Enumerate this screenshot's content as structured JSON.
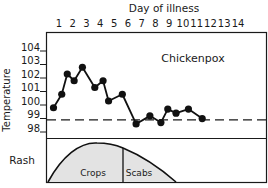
{
  "chart_data": {
    "type": "line",
    "title": "Chickenpox",
    "xlabel": "Day of illness",
    "ylabel": "Temperature",
    "x_ticks": [
      "1",
      "2",
      "3",
      "4",
      "5",
      "6",
      "7",
      "8",
      "9",
      "10",
      "11",
      "12",
      "13",
      "14"
    ],
    "y_ticks": [
      "104",
      "103",
      "102",
      "101",
      "100",
      "99",
      "98"
    ],
    "ylim": [
      98,
      104
    ],
    "reference_line": {
      "value": 98.6,
      "style": "dashed"
    },
    "series": [
      {
        "name": "Temperature",
        "x": [
          0.6,
          1.2,
          1.6,
          2.1,
          2.7,
          3.6,
          4.2,
          4.6,
          5.6,
          6.6,
          7.6,
          8.4,
          8.9,
          9.5,
          10.4,
          11.4
        ],
        "values": [
          99.5,
          100.5,
          102.0,
          101.5,
          102.5,
          101.0,
          101.5,
          100.0,
          100.5,
          98.3,
          98.9,
          98.4,
          99.4,
          99.1,
          99.4,
          98.7
        ]
      }
    ],
    "rash_panel": {
      "label": "Rash",
      "phases": [
        {
          "name": "Crops",
          "start_day": 0.5,
          "end_day": 5.5
        },
        {
          "name": "Scabs",
          "start_day": 5.5,
          "end_day": 9.3
        }
      ],
      "peak_day": 3.6
    },
    "grid": false,
    "legend": "none"
  },
  "labels": {
    "x_title": "Day of illness",
    "y_title": "Temperature",
    "chart_title": "Chickenpox",
    "rash_label": "Rash",
    "crops_label": "Crops",
    "scabs_label": "Scabs",
    "days": [
      "1",
      "2",
      "3",
      "4",
      "5",
      "6",
      "7",
      "8",
      "9",
      "10",
      "11",
      "12",
      "13",
      "14"
    ],
    "temps": [
      "104",
      "103",
      "102",
      "101",
      "100",
      "99",
      "98"
    ]
  }
}
